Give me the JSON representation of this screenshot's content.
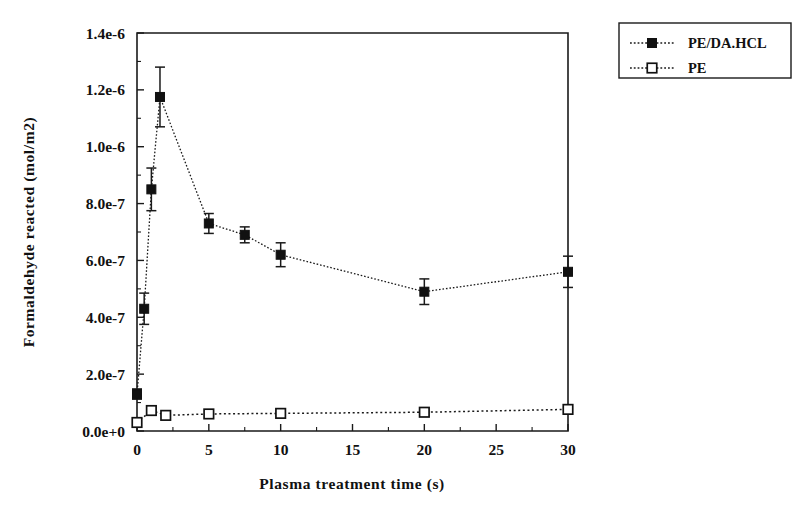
{
  "chart_data": {
    "type": "line",
    "title": "",
    "xlabel": "Plasma treatment time (s)",
    "ylabel": "Formaldehyde reacted  (mol/m2)",
    "xlim": [
      0,
      30
    ],
    "ylim": [
      0,
      1.4e-06
    ],
    "xticks": [
      0,
      5,
      10,
      15,
      20,
      25,
      30
    ],
    "xticklabels": [
      "0",
      "5",
      "10",
      "15",
      "20",
      "25",
      "30"
    ],
    "yticks": [
      0,
      2e-07,
      4e-07,
      6e-07,
      8e-07,
      1e-06,
      1.2e-06,
      1.4e-06
    ],
    "yticklabels": [
      "0.0e+0",
      "2.0e-7",
      "4.0e-7",
      "6.0e-7",
      "8.0e-7",
      "1.0e-6",
      "1.2e-6",
      "1.4e-6"
    ],
    "grid": false,
    "legend_position": "outside-top-right",
    "marker_color": "#111111",
    "line_color": "#1a1a1a",
    "series": [
      {
        "name": "PE/DA.HCL",
        "marker": "filled-square",
        "linestyle": "dotted",
        "x": [
          0,
          0.5,
          1.0,
          1.6,
          5.0,
          7.5,
          10.0,
          20.0,
          30.0
        ],
        "values": [
          1.3e-07,
          4.3e-07,
          8.5e-07,
          1.175e-06,
          7.3e-07,
          6.9e-07,
          6.2e-07,
          4.9e-07,
          5.6e-07
        ],
        "errors": [
          1.8e-08,
          5.5e-08,
          7.5e-08,
          1.05e-07,
          3.5e-08,
          2.8e-08,
          4.2e-08,
          4.5e-08,
          5.5e-08
        ]
      },
      {
        "name": "PE",
        "marker": "open-square",
        "linestyle": "dotted",
        "x": [
          0,
          1.0,
          2.0,
          5.0,
          10.0,
          20.0,
          30.0
        ],
        "values": [
          3e-08,
          7.2e-08,
          5.5e-08,
          6e-08,
          6.2e-08,
          6.6e-08,
          7.6e-08
        ],
        "errors": [
          0,
          0,
          0,
          0,
          0,
          0,
          0
        ]
      }
    ],
    "legend": [
      {
        "label": "PE/DA.HCL",
        "marker": "filled-square"
      },
      {
        "label": "PE",
        "marker": "open-square"
      }
    ]
  }
}
